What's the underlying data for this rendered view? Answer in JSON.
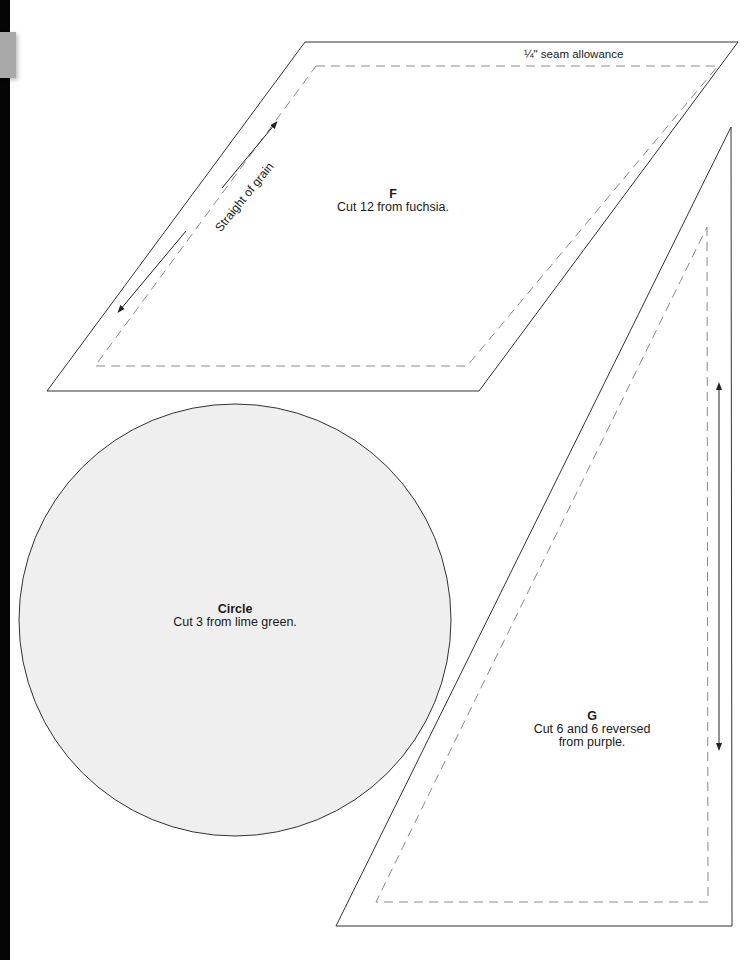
{
  "page": {
    "background": "#ffffff",
    "edge_bar_color": "#050505",
    "edge_tab_color": "#a9a9a9"
  },
  "pieces": {
    "F": {
      "letter": "F",
      "instruction": "Cut 12 from fuchsia.",
      "seam_label": "¼\" seam allowance",
      "grain_label": "Straight of grain",
      "shape": "parallelogram",
      "fill": "#ffffff"
    },
    "circle": {
      "title": "Circle",
      "instruction": "Cut 3 from lime green.",
      "shape": "circle",
      "fill": "#efefef"
    },
    "G": {
      "letter": "G",
      "instruction_line1": "Cut 6 and 6 reversed",
      "instruction_line2": "from purple.",
      "shape": "right-triangle",
      "fill": "#ffffff"
    }
  },
  "colors": {
    "cut_line": "#333333",
    "seam_line": "#8a8a8a",
    "arrow": "#222222"
  }
}
